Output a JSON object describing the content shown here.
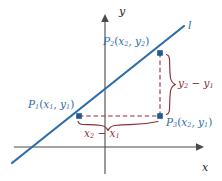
{
  "figure": {
    "colors": {
      "line": "#2f6ca8",
      "point": "#1d5a96",
      "axis": "#4a4a4a",
      "difference": "#8f2d35"
    }
  },
  "axes": {
    "x_label": "x",
    "y_label": "y",
    "x_axis_name": "x-axis",
    "y_axis_name": "y-axis"
  },
  "line": {
    "label": "l"
  },
  "points": [
    {
      "id": "P2",
      "name": "P",
      "sub": "2",
      "coord_x": "x",
      "coord_x_sub": "2",
      "coord_y": "y",
      "coord_y_sub": "2",
      "label": "P₂(x₂, y₂)"
    },
    {
      "id": "P1",
      "name": "P",
      "sub": "1",
      "coord_x": "x",
      "coord_x_sub": "1",
      "coord_y": "y",
      "coord_y_sub": "1",
      "label": "P₁(x₁, y₁)"
    },
    {
      "id": "P3",
      "name": "P",
      "sub": "3",
      "coord_x": "x",
      "coord_x_sub": "2",
      "coord_y": "y",
      "coord_y_sub": "1",
      "label": "P₃(x₂, y₁)"
    }
  ],
  "differences": {
    "rise": {
      "lead": "y",
      "lead_sub": "2",
      "minus": "−",
      "trail": "y",
      "trail_sub": "1",
      "label": "y₂ − y₁"
    },
    "run": {
      "lead": "x",
      "lead_sub": "2",
      "minus": "−",
      "trail": "x",
      "trail_sub": "1",
      "label": "x₂ − x₁"
    }
  },
  "punctuation": {
    "open_paren": "(",
    "close_paren": ")",
    "comma": ","
  }
}
